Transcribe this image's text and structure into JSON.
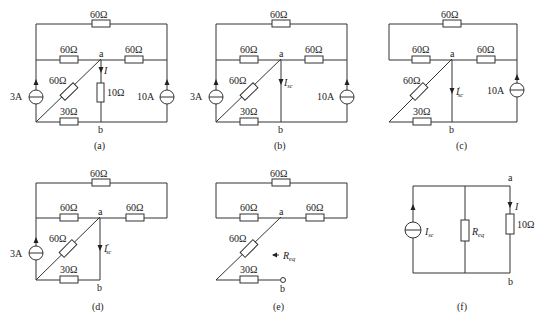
{
  "figure": {
    "panels": [
      {
        "id": "a",
        "caption": "(a)",
        "node_a": "a",
        "node_b": "b",
        "top_resistor": "60Ω",
        "left_mid_resistor": "60Ω",
        "right_mid_resistor": "60Ω",
        "diag_resistor": "60Ω",
        "bottom_resistor": "30Ω",
        "load_resistor": "10Ω",
        "current_label": "I",
        "left_source": "3A",
        "right_source": "10A"
      },
      {
        "id": "b",
        "caption": "(b)",
        "node_a": "a",
        "node_b": "b",
        "top_resistor": "60Ω",
        "left_mid_resistor": "60Ω",
        "right_mid_resistor": "60Ω",
        "diag_resistor": "60Ω",
        "bottom_resistor": "30Ω",
        "current_label": "I",
        "current_sub": "sc",
        "left_source": "3A",
        "right_source": "10A"
      },
      {
        "id": "c",
        "caption": "(c)",
        "node_a": "a",
        "node_b": "b",
        "top_resistor": "60Ω",
        "left_mid_resistor": "60Ω",
        "right_mid_resistor": "60Ω",
        "diag_resistor": "60Ω",
        "bottom_resistor": "30Ω",
        "current_label": "I",
        "current_sup": "′",
        "current_sub": "sc",
        "right_source": "10A"
      },
      {
        "id": "d",
        "caption": "(d)",
        "node_a": "a",
        "node_b": "b",
        "top_resistor": "60Ω",
        "left_mid_resistor": "60Ω",
        "right_mid_resistor": "60Ω",
        "diag_resistor": "60Ω",
        "bottom_resistor": "30Ω",
        "current_label": "I",
        "current_sup": "″",
        "current_sub": "sc",
        "left_source": "3A"
      },
      {
        "id": "e",
        "caption": "(e)",
        "node_a": "a",
        "node_b": "b",
        "top_resistor": "60Ω",
        "left_mid_resistor": "60Ω",
        "right_mid_resistor": "60Ω",
        "diag_resistor": "60Ω",
        "bottom_resistor": "30Ω",
        "req_label": "R",
        "req_sub": "eq"
      },
      {
        "id": "f",
        "caption": "(f)",
        "node_a": "a",
        "node_b": "b",
        "source_label": "I",
        "source_sub": "sc",
        "req_label": "R",
        "req_sub": "eq",
        "load_resistor": "10Ω",
        "current_label": "I"
      }
    ]
  }
}
